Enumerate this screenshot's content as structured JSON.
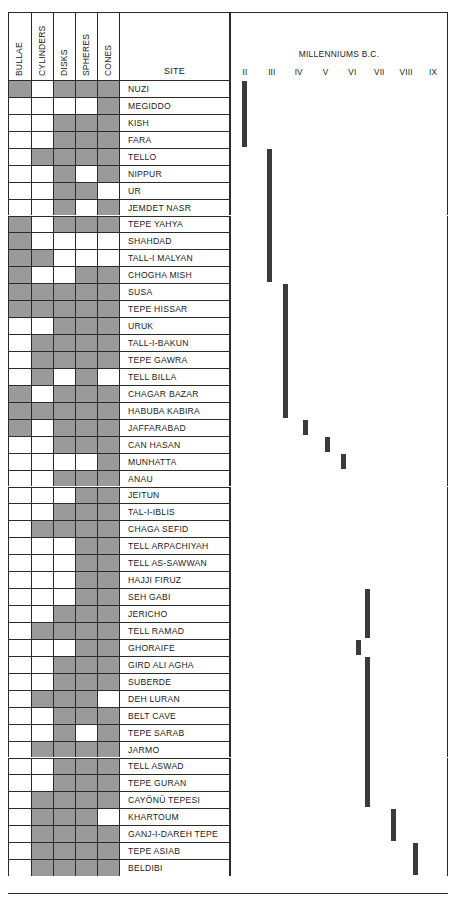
{
  "chart_data": {
    "type": "table",
    "title": "MILLENNIUMS B.C.",
    "attribute_columns": [
      "BULLAE",
      "CYLINDERS",
      "DISKS",
      "SPHERES",
      "CONES"
    ],
    "site_column_header": "SITE",
    "timeline_header": "MILLENNIUMS B.C.",
    "timeline_ticks": [
      "II",
      "III",
      "IV",
      "V",
      "VI",
      "VII",
      "VIII",
      "IX"
    ],
    "xlim": [
      2,
      9
    ],
    "grid": false,
    "legend": "none",
    "rows": [
      {
        "site": "NUZI",
        "bullae": 1,
        "cylinders": 0,
        "disks": 1,
        "spheres": 1,
        "cones": 1,
        "bar_start": 2.02,
        "bar_end": 2.3
      },
      {
        "site": "MEGIDDO",
        "bullae": 0,
        "cylinders": 0,
        "disks": 0,
        "spheres": 0,
        "cones": 1,
        "bar_start": 2.02,
        "bar_end": 2.3
      },
      {
        "site": "KISH",
        "bullae": 0,
        "cylinders": 0,
        "disks": 1,
        "spheres": 1,
        "cones": 1,
        "bar_start": 2.02,
        "bar_end": 2.3
      },
      {
        "site": "FARA",
        "bullae": 0,
        "cylinders": 0,
        "disks": 1,
        "spheres": 1,
        "cones": 1,
        "bar_start": 2.02,
        "bar_end": 2.3
      },
      {
        "site": "TELLO",
        "bullae": 0,
        "cylinders": 1,
        "disks": 1,
        "spheres": 1,
        "cones": 1,
        "bar_start": 2.95,
        "bar_end": 3.2
      },
      {
        "site": "NIPPUR",
        "bullae": 0,
        "cylinders": 0,
        "disks": 1,
        "spheres": 0,
        "cones": 1,
        "bar_start": 2.95,
        "bar_end": 3.2
      },
      {
        "site": "UR",
        "bullae": 0,
        "cylinders": 0,
        "disks": 1,
        "spheres": 1,
        "cones": 0,
        "bar_start": 2.95,
        "bar_end": 3.2
      },
      {
        "site": "JEMDET NASR",
        "bullae": 0,
        "cylinders": 0,
        "disks": 1,
        "spheres": 0,
        "cones": 1,
        "bar_start": 2.95,
        "bar_end": 3.2
      },
      {
        "site": "TEPE YAHYA",
        "bullae": 1,
        "cylinders": 0,
        "disks": 1,
        "spheres": 1,
        "cones": 1,
        "bar_start": 2.95,
        "bar_end": 3.2
      },
      {
        "site": "SHAHDAD",
        "bullae": 1,
        "cylinders": 0,
        "disks": 0,
        "spheres": 0,
        "cones": 0,
        "bar_start": 2.95,
        "bar_end": 3.2
      },
      {
        "site": "TALL-I MALYAN",
        "bullae": 1,
        "cylinders": 1,
        "disks": 0,
        "spheres": 0,
        "cones": 0,
        "bar_start": 2.95,
        "bar_end": 3.2
      },
      {
        "site": "CHOGHA MISH",
        "bullae": 1,
        "cylinders": 0,
        "disks": 0,
        "spheres": 1,
        "cones": 1,
        "bar_start": 2.95,
        "bar_end": 3.2
      },
      {
        "site": "SUSA",
        "bullae": 1,
        "cylinders": 1,
        "disks": 1,
        "spheres": 1,
        "cones": 1,
        "bar_start": 3.55,
        "bar_end": 4.3
      },
      {
        "site": "TEPE HISSAR",
        "bullae": 1,
        "cylinders": 1,
        "disks": 1,
        "spheres": 1,
        "cones": 1,
        "bar_start": 3.55,
        "bar_end": 4.3
      },
      {
        "site": "URUK",
        "bullae": 0,
        "cylinders": 0,
        "disks": 1,
        "spheres": 1,
        "cones": 1,
        "bar_start": 3.55,
        "bar_end": 4.3
      },
      {
        "site": "TALL-I-BAKUN",
        "bullae": 0,
        "cylinders": 1,
        "disks": 1,
        "spheres": 1,
        "cones": 1,
        "bar_start": 3.55,
        "bar_end": 4.3
      },
      {
        "site": "TEPE GAWRA",
        "bullae": 0,
        "cylinders": 1,
        "disks": 1,
        "spheres": 1,
        "cones": 1,
        "bar_start": 3.55,
        "bar_end": 4.3
      },
      {
        "site": "TELL BILLA",
        "bullae": 0,
        "cylinders": 1,
        "disks": 0,
        "spheres": 1,
        "cones": 0,
        "bar_start": 3.55,
        "bar_end": 4.3
      },
      {
        "site": "CHAGAR BAZAR",
        "bullae": 1,
        "cylinders": 0,
        "disks": 1,
        "spheres": 1,
        "cones": 1,
        "bar_start": 3.55,
        "bar_end": 4.3
      },
      {
        "site": "HABUBA KABIRA",
        "bullae": 1,
        "cylinders": 1,
        "disks": 1,
        "spheres": 1,
        "cones": 1,
        "bar_start": 3.55,
        "bar_end": 4.3
      },
      {
        "site": "JAFFARABAD",
        "bullae": 1,
        "cylinders": 0,
        "disks": 1,
        "spheres": 1,
        "cones": 1,
        "bar_start": 4.3,
        "bar_end": 4.7
      },
      {
        "site": "CAN HASAN",
        "bullae": 0,
        "cylinders": 0,
        "disks": 1,
        "spheres": 1,
        "cones": 1,
        "bar_start": 5.1,
        "bar_end": 5.75
      },
      {
        "site": "MUNHATTA",
        "bullae": 0,
        "cylinders": 0,
        "disks": 0,
        "spheres": 0,
        "cones": 1,
        "bar_start": 5.7,
        "bar_end": 6.5
      },
      {
        "site": "ANAU",
        "bullae": 0,
        "cylinders": 0,
        "disks": 1,
        "spheres": 1,
        "cones": 1,
        "bar_start": null,
        "bar_end": null
      },
      {
        "site": "JEITUN",
        "bullae": 0,
        "cylinders": 0,
        "disks": 0,
        "spheres": 1,
        "cones": 1,
        "bar_start": null,
        "bar_end": null
      },
      {
        "site": "TAL-I-IBLIS",
        "bullae": 0,
        "cylinders": 0,
        "disks": 1,
        "spheres": 1,
        "cones": 1,
        "bar_start": null,
        "bar_end": null
      },
      {
        "site": "CHAGA SEFID",
        "bullae": 0,
        "cylinders": 1,
        "disks": 1,
        "spheres": 1,
        "cones": 1,
        "bar_start": null,
        "bar_end": null
      },
      {
        "site": "TELL ARPACHIYAH",
        "bullae": 0,
        "cylinders": 0,
        "disks": 0,
        "spheres": 1,
        "cones": 1,
        "bar_start": null,
        "bar_end": null
      },
      {
        "site": "TELL AS-SAWWAN",
        "bullae": 0,
        "cylinders": 0,
        "disks": 0,
        "spheres": 1,
        "cones": 1,
        "bar_start": null,
        "bar_end": null
      },
      {
        "site": "HAJJI FIRUZ",
        "bullae": 0,
        "cylinders": 0,
        "disks": 0,
        "spheres": 1,
        "cones": 1,
        "bar_start": null,
        "bar_end": null
      },
      {
        "site": "SEH GABI",
        "bullae": 0,
        "cylinders": 0,
        "disks": 0,
        "spheres": 1,
        "cones": 1,
        "bar_start": 6.6,
        "bar_end": 7.55
      },
      {
        "site": "JERICHO",
        "bullae": 0,
        "cylinders": 0,
        "disks": 1,
        "spheres": 1,
        "cones": 1,
        "bar_start": 6.6,
        "bar_end": 7.55
      },
      {
        "site": "TELL RAMAD",
        "bullae": 0,
        "cylinders": 1,
        "disks": 1,
        "spheres": 1,
        "cones": 1,
        "bar_start": 6.6,
        "bar_end": 7.55
      },
      {
        "site": "GHORAIFE",
        "bullae": 0,
        "cylinders": 0,
        "disks": 0,
        "spheres": 1,
        "cones": 1,
        "bar_start": 6.25,
        "bar_end": 6.6
      },
      {
        "site": "GIRD ALI AGHA",
        "bullae": 0,
        "cylinders": 0,
        "disks": 1,
        "spheres": 1,
        "cones": 1,
        "bar_start": 6.6,
        "bar_end": 7.55
      },
      {
        "site": "SUBERDE",
        "bullae": 0,
        "cylinders": 0,
        "disks": 1,
        "spheres": 1,
        "cones": 1,
        "bar_start": 6.6,
        "bar_end": 7.55
      },
      {
        "site": "DEH LURAN",
        "bullae": 0,
        "cylinders": 1,
        "disks": 1,
        "spheres": 1,
        "cones": 0,
        "bar_start": 6.6,
        "bar_end": 7.55
      },
      {
        "site": "BELT CAVE",
        "bullae": 0,
        "cylinders": 0,
        "disks": 1,
        "spheres": 1,
        "cones": 1,
        "bar_start": 6.6,
        "bar_end": 7.55
      },
      {
        "site": "TEPE SARAB",
        "bullae": 0,
        "cylinders": 0,
        "disks": 1,
        "spheres": 0,
        "cones": 1,
        "bar_start": 6.6,
        "bar_end": 7.55
      },
      {
        "site": "JARMO",
        "bullae": 0,
        "cylinders": 1,
        "disks": 1,
        "spheres": 1,
        "cones": 1,
        "bar_start": 6.6,
        "bar_end": 7.55
      },
      {
        "site": "TELL ASWAD",
        "bullae": 0,
        "cylinders": 0,
        "disks": 1,
        "spheres": 1,
        "cones": 1,
        "bar_start": 6.6,
        "bar_end": 7.55
      },
      {
        "site": "TEPE GURAN",
        "bullae": 0,
        "cylinders": 0,
        "disks": 1,
        "spheres": 1,
        "cones": 1,
        "bar_start": 6.6,
        "bar_end": 7.55
      },
      {
        "site": "CAYÖNÜ TEPESI",
        "bullae": 0,
        "cylinders": 1,
        "disks": 1,
        "spheres": 1,
        "cones": 1,
        "bar_start": 6.6,
        "bar_end": 7.55
      },
      {
        "site": "KHARTOUM",
        "bullae": 0,
        "cylinders": 1,
        "disks": 1,
        "spheres": 1,
        "cones": 0,
        "bar_start": 7.55,
        "bar_end": 8.15
      },
      {
        "site": "GANJ-I-DAREH TEPE",
        "bullae": 0,
        "cylinders": 1,
        "disks": 1,
        "spheres": 1,
        "cones": 1,
        "bar_start": 7.55,
        "bar_end": 8.15
      },
      {
        "site": "TEPE ASIAB",
        "bullae": 0,
        "cylinders": 1,
        "disks": 1,
        "spheres": 1,
        "cones": 1,
        "bar_start": 8.4,
        "bar_end": 9.0
      },
      {
        "site": "BELDIBI",
        "bullae": 0,
        "cylinders": 1,
        "disks": 1,
        "spheres": 1,
        "cones": 1,
        "bar_start": 8.4,
        "bar_end": 9.0
      }
    ]
  },
  "colors": {
    "cell_filled": "#9a9a9a",
    "cell_empty": "#ffffff",
    "bar": "#3a3a3a",
    "rule": "#2b2b2b"
  }
}
